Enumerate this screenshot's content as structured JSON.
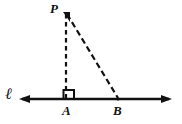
{
  "figure": {
    "background_color": "#ffffff",
    "stroke_color": "#111111",
    "labels": {
      "apex": "P",
      "foot": "A",
      "base_point": "B",
      "line": "ℓ"
    },
    "points": {
      "P": {
        "x": 66,
        "y": 13
      },
      "A": {
        "x": 66,
        "y": 99
      },
      "B": {
        "x": 118,
        "y": 99
      }
    },
    "line_l": {
      "y": 99,
      "x_start": 19,
      "x_end": 172,
      "arrow_left": true,
      "arrow_right": true,
      "stroke_width": 2.4
    },
    "segments": [
      {
        "name": "PA",
        "style": "dashed",
        "from": "P",
        "to": "A"
      },
      {
        "name": "PB",
        "style": "dashed",
        "from": "P",
        "to": "B"
      }
    ],
    "right_angle_marker": {
      "at": "A",
      "size": 11,
      "position": "right-of-vertical-above-line"
    }
  }
}
